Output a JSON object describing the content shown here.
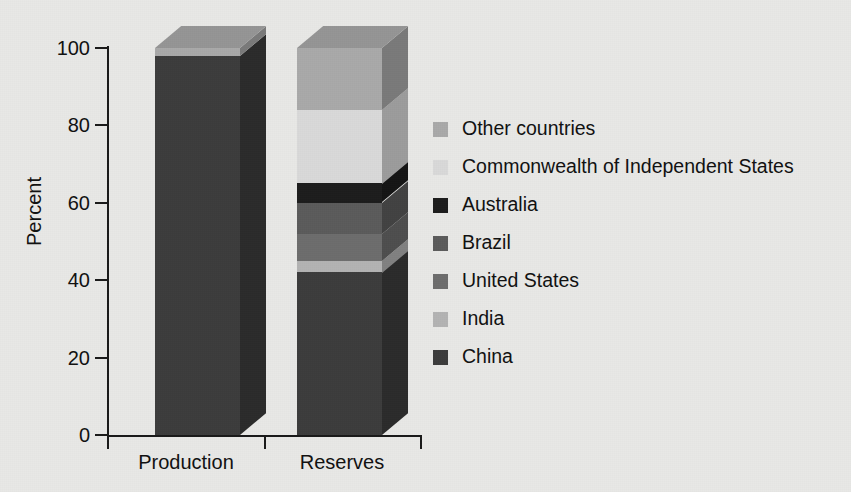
{
  "chart_data": {
    "type": "bar",
    "subtype": "stacked-3d-column",
    "title": "",
    "xlabel": "",
    "ylabel": "Percent",
    "ylim": [
      0,
      100
    ],
    "yticks": [
      0,
      20,
      40,
      60,
      80,
      100
    ],
    "ytick_labels": [
      "0",
      "20",
      "40",
      "60",
      "80",
      "100"
    ],
    "grid": false,
    "legend_position": "right",
    "categories": [
      "Production",
      "Reserves"
    ],
    "series": [
      {
        "name": "China",
        "values": [
          98,
          42
        ],
        "color": "#3c3c3c"
      },
      {
        "name": "India",
        "values": [
          0,
          3
        ],
        "color": "#b3b3b3"
      },
      {
        "name": "United States",
        "values": [
          0,
          7
        ],
        "color": "#6d6d6d"
      },
      {
        "name": "Brazil",
        "values": [
          0,
          8
        ],
        "color": "#5b5b5b"
      },
      {
        "name": "Australia",
        "values": [
          0,
          5
        ],
        "color": "#1d1d1d"
      },
      {
        "name": "Commonwealth of Independent States",
        "values": [
          0,
          19
        ],
        "color": "#d9d9d9"
      },
      {
        "name": "Other countries",
        "values": [
          2,
          16
        ],
        "color": "#a9a9a9"
      }
    ]
  },
  "axis": {
    "y_title": "Percent",
    "y_tick_labels": [
      "100",
      "80",
      "60",
      "40",
      "20",
      "0"
    ],
    "x_categories": [
      "Production",
      "Reserves"
    ]
  },
  "legend": {
    "items": [
      {
        "label": "Other countries",
        "color": "#a9a9a9"
      },
      {
        "label": "Commonwealth of Independent States",
        "color": "#d9d9d9"
      },
      {
        "label": "Australia",
        "color": "#1d1d1d"
      },
      {
        "label": "Brazil",
        "color": "#5b5b5b"
      },
      {
        "label": "United States",
        "color": "#6d6d6d"
      },
      {
        "label": "India",
        "color": "#b3b3b3"
      },
      {
        "label": "China",
        "color": "#3c3c3c"
      }
    ]
  },
  "style": {
    "background": "#e8e8e6",
    "axis_color": "#1a1a1a",
    "text_color": "#111111"
  }
}
